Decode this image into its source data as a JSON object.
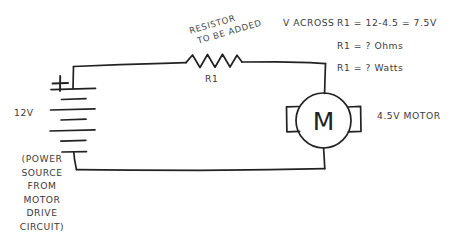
{
  "diagram": {
    "title_text": "Hand-drawn series circuit: 12V source, resistor R1, 4.5V motor",
    "stroke_color": "#222222",
    "text_color": "#3b3b3b",
    "background_color": "#ffffff"
  },
  "annotations": {
    "resistor_note_line1": "RESISTOR",
    "resistor_note_line2": "TO BE ADDED",
    "v_across_label": "V ACROSS",
    "calc_line1": "R1 = 12-4.5 = 7.5V",
    "calc_line2": "R1 = ? Ohms",
    "calc_line3": "R1 = ? Watts",
    "motor_label": "4.5V MOTOR"
  },
  "components": {
    "resistor_label": "R1",
    "battery_voltage_label": "12V",
    "battery_polarity_label": "+",
    "motor_symbol_letter": "M",
    "source_note": "(POWER\nSOURCE\nFROM\nMOTOR\nDRIVE\nCIRCUIT)"
  },
  "icons": {
    "resistor": "resistor-zigzag-icon",
    "battery": "battery-cells-icon",
    "motor": "motor-circle-icon",
    "wire": "wire-line-icon"
  }
}
